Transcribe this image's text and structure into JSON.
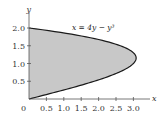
{
  "chart_data": {
    "type": "area",
    "title": "",
    "xlabel": "x",
    "ylabel": "y",
    "annotation": "x = 4y − y³",
    "curve": "x = 4y - y^3",
    "origin_label": "0",
    "x_ticks": [
      "0.5",
      "1.0",
      "1.5",
      "2.0",
      "2.5",
      "3.0"
    ],
    "y_ticks": [
      "0.5",
      "1.0",
      "1.5",
      "2.0"
    ],
    "xlim": [
      0,
      3.4
    ],
    "ylim": [
      0,
      2.2
    ],
    "grid": false,
    "region": "shaded area between y-axis and curve x = 4y - y^3 for 0 ≤ y ≤ 2",
    "points": [
      {
        "y": 0.0,
        "x": 0.0
      },
      {
        "y": 0.25,
        "x": 0.984
      },
      {
        "y": 0.5,
        "x": 1.875
      },
      {
        "y": 0.75,
        "x": 2.578
      },
      {
        "y": 1.0,
        "x": 3.0
      },
      {
        "y": 1.155,
        "x": 3.079
      },
      {
        "y": 1.25,
        "x": 3.047
      },
      {
        "y": 1.5,
        "x": 2.625
      },
      {
        "y": 1.75,
        "x": 1.641
      },
      {
        "y": 2.0,
        "x": 0.0
      }
    ],
    "colors": {
      "fill": "#c8c8c8",
      "curve": "#1a1a1a",
      "axes": "#555555"
    }
  }
}
